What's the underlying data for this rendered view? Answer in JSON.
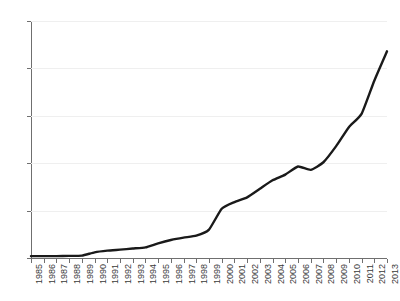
{
  "chart_data": {
    "type": "line",
    "title": "",
    "subtitle": "",
    "xlabel": "",
    "ylabel": "",
    "grid": true,
    "legend": false,
    "legend_position": "none",
    "line_color": "#1a1a1a",
    "grid_color": "#efefef",
    "axis_color": "#6f6f6f",
    "xlim": [
      "1985",
      "2013"
    ],
    "ylim": [
      0,
      2500
    ],
    "y_ticks": [
      0,
      500,
      1000,
      1500,
      2000,
      2500
    ],
    "y_tick_labels": [
      "0",
      "500",
      "1000",
      "1500",
      "2000",
      "2500"
    ],
    "categories": [
      "1985",
      "1986",
      "1987",
      "1988",
      "1989",
      "1990",
      "1991",
      "1992",
      "1993",
      "1994",
      "1995",
      "1996",
      "1997",
      "1998",
      "1999",
      "2000",
      "2001",
      "2002",
      "2003",
      "2004",
      "2005",
      "2006",
      "2007",
      "2008",
      "2009",
      "2010",
      "2011",
      "2012",
      "2013"
    ],
    "values": [
      20,
      20,
      20,
      22,
      25,
      60,
      75,
      85,
      100,
      110,
      150,
      190,
      215,
      230,
      300,
      510,
      570,
      620,
      700,
      790,
      870,
      950,
      920,
      980,
      1120,
      1320,
      1450,
      1620,
      1800
    ],
    "series": [
      {
        "name": "value",
        "values": [
          20,
          20,
          20,
          22,
          25,
          60,
          75,
          85,
          100,
          110,
          150,
          190,
          215,
          230,
          300,
          510,
          570,
          620,
          700,
          790,
          870,
          950,
          920,
          980,
          1120,
          1320,
          1450,
          1620,
          1800
        ]
      }
    ],
    "plot_points": [
      {
        "x": "1985",
        "y": 20
      },
      {
        "x": "1986",
        "y": 20
      },
      {
        "x": "1987",
        "y": 20
      },
      {
        "x": "1988",
        "y": 22
      },
      {
        "x": "1989",
        "y": 25
      },
      {
        "x": "1990",
        "y": 60
      },
      {
        "x": "1991",
        "y": 78
      },
      {
        "x": "1992",
        "y": 88
      },
      {
        "x": "1993",
        "y": 100
      },
      {
        "x": "1994",
        "y": 112
      },
      {
        "x": "1995",
        "y": 155
      },
      {
        "x": "1996",
        "y": 190
      },
      {
        "x": "1997",
        "y": 215
      },
      {
        "x": "1998",
        "y": 235
      },
      {
        "x": "1999",
        "y": 300
      },
      {
        "x": "2000",
        "y": 520
      },
      {
        "x": "2001",
        "y": 590
      },
      {
        "x": "2002",
        "y": 640
      },
      {
        "x": "2003",
        "y": 730
      },
      {
        "x": "2004",
        "y": 820
      },
      {
        "x": "2005",
        "y": 880
      },
      {
        "x": "2006",
        "y": 965
      },
      {
        "x": "2007",
        "y": 930
      },
      {
        "x": "2008",
        "y": 1010
      },
      {
        "x": "2009",
        "y": 1180
      },
      {
        "x": "2010",
        "y": 1380
      },
      {
        "x": "2011",
        "y": 1520
      },
      {
        "x": "2012",
        "y": 1870
      },
      {
        "x": "2013",
        "y": 2180
      }
    ]
  }
}
